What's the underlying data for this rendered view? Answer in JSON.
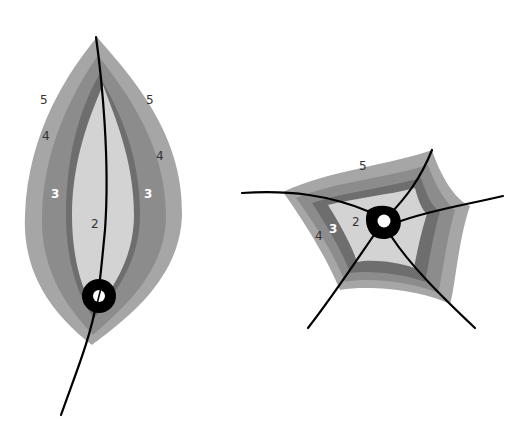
{
  "colors": {
    "background": "#ffffff",
    "zone5": "#a6a6a6",
    "zone4": "#8c8c8c",
    "zone3": "#6e6e6e",
    "zone2": "#d3d3d3",
    "line": "#000000",
    "hole": "#ffffff"
  },
  "leaf": {
    "labels": {
      "left5": "5",
      "right5": "5",
      "left4": "4",
      "right4": "4",
      "left3": "3",
      "right3": "3",
      "center2": "2"
    }
  },
  "star": {
    "labels": {
      "top5": "5",
      "left4": "4",
      "left3": "3",
      "left2": "2"
    }
  }
}
